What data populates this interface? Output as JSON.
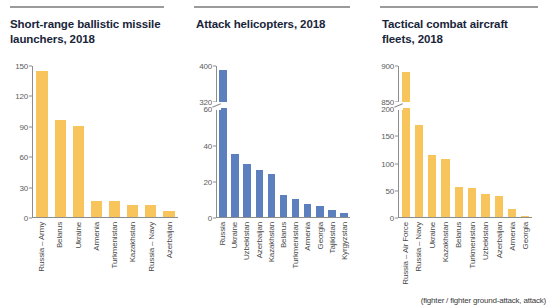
{
  "colors": {
    "amber": "#f7c55b",
    "blue": "#5c7fbe",
    "title": "#19253a",
    "axis": "#8d8d8d",
    "tick_text": "#5c5c5c",
    "label_text": "#4a4a4a",
    "rule": "#9b9b9b",
    "background": "#ffffff"
  },
  "panels": [
    {
      "title": "Short-range ballistic missile launchers, 2018",
      "footnote": ""
    },
    {
      "title": "Attack helicopters, 2018",
      "footnote": ""
    },
    {
      "title": "Tactical combat aircraft fleets, 2018",
      "footnote": "(fighter / fighter ground-attack, attack)"
    }
  ],
  "chart_data": [
    {
      "type": "bar",
      "title": "Short-range ballistic missile launchers, 2018",
      "xlabel": "",
      "ylabel": "",
      "ylim": [
        0,
        150
      ],
      "yticks": [
        0,
        30,
        60,
        90,
        120,
        150
      ],
      "ytick_labels": [
        "0",
        "30",
        "60",
        "90",
        "120",
        "150"
      ],
      "grid": false,
      "legend": "none",
      "broken_axis": false,
      "series_color": "#f7c55b",
      "categories": [
        "Russia – Army",
        "Belarus",
        "Ukraine",
        "Armenia",
        "Turkmenistan",
        "Kazakhstan",
        "Russia – Navy",
        "Azerbaijan"
      ],
      "values": [
        144,
        96,
        90,
        16,
        16,
        12,
        12,
        6
      ]
    },
    {
      "type": "bar",
      "title": "Attack helicopters, 2018",
      "xlabel": "",
      "ylabel": "",
      "grid": false,
      "legend": "none",
      "broken_axis": true,
      "axis_break_between": [
        60,
        320
      ],
      "yticks": [
        0,
        20,
        40,
        60,
        320,
        400
      ],
      "ytick_labels": [
        "0",
        "20",
        "40",
        "60",
        "320",
        "400"
      ],
      "series_color": "#5c7fbe",
      "categories": [
        "Russia",
        "Ukraine",
        "Uzbekistan",
        "Azerbaijan",
        "Kazakhstan",
        "Belarus",
        "Turkmenistan",
        "Armenia",
        "Georgia",
        "Tajikistan",
        "Kyrgyzstan"
      ],
      "values": [
        390,
        35,
        29,
        26,
        24,
        12,
        10,
        7,
        6,
        4,
        2
      ]
    },
    {
      "type": "bar",
      "title": "Tactical combat aircraft fleets, 2018",
      "xlabel": "",
      "ylabel": "",
      "grid": false,
      "legend": "none",
      "broken_axis": true,
      "axis_break_between": [
        200,
        850
      ],
      "yticks": [
        0,
        50,
        100,
        150,
        200,
        850,
        900
      ],
      "ytick_labels": [
        "0",
        "50",
        "100",
        "150",
        "200",
        "850",
        "900"
      ],
      "series_color": "#f7c55b",
      "annotation": "(fighter / fighter ground-attack, attack)",
      "categories": [
        "Russia – Air Force",
        "Russia – Navy",
        "Ukraine",
        "Kazakhstan",
        "Belarus",
        "Turkmenistan",
        "Uzbekistan",
        "Azerbaijan",
        "Armenia",
        "Georgia"
      ],
      "values": [
        890,
        170,
        115,
        106,
        55,
        54,
        42,
        38,
        15,
        2
      ]
    }
  ]
}
